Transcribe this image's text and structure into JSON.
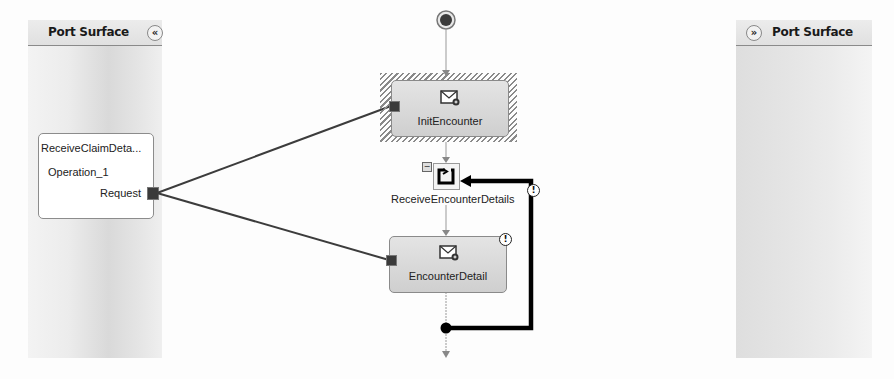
{
  "port_surfaces": {
    "left": {
      "title": "Port Surface",
      "collapse_icon": "«"
    },
    "right": {
      "title": "Port Surface",
      "expand_icon": "»"
    }
  },
  "ports": [
    {
      "name": "ReceiveClaimDeta...",
      "operation": "Operation_1",
      "message": "Request"
    }
  ],
  "orchestration": {
    "shapes": [
      {
        "type": "receive",
        "label": "InitEncounter",
        "selected": true,
        "icon": "message-receive-icon"
      },
      {
        "type": "loop",
        "label": "ReceiveEncounterDetails",
        "icon": "loop-icon",
        "collapse_toggle": "−",
        "warning": "!"
      },
      {
        "type": "receive",
        "label": "EncounterDetail",
        "icon": "message-receive-icon",
        "warning": "!"
      }
    ]
  },
  "colors": {
    "connector": "#3c3c3c",
    "loop_line": "#000000",
    "shape_fill": "#d8d8d8",
    "panel": "#e2e2e2"
  }
}
